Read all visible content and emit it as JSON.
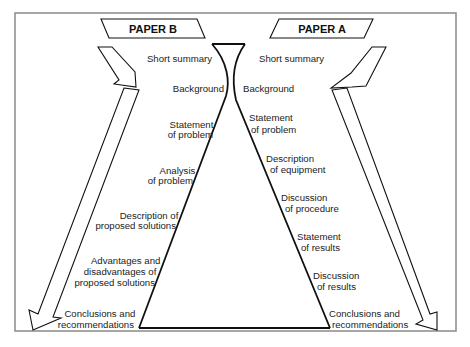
{
  "diagram": {
    "paper_b": {
      "title": "PAPER B",
      "sections": [
        [
          "Short summary"
        ],
        [
          "Background"
        ],
        [
          "Statement",
          "of problem"
        ],
        [
          "Analysis",
          "of problem"
        ],
        [
          "Description of",
          "proposed solutions"
        ],
        [
          "Advantages and",
          "disadvantages of",
          "proposed solutions"
        ],
        [
          "Conclusions and",
          "recommendations"
        ]
      ]
    },
    "paper_a": {
      "title": "PAPER A",
      "sections": [
        [
          "Short summary"
        ],
        [
          "Background"
        ],
        [
          "Statement",
          "of problem"
        ],
        [
          "Description",
          "of equipment"
        ],
        [
          "Discussion",
          "of procedure"
        ],
        [
          "Statement",
          "of results"
        ],
        [
          "Discussion",
          "of results"
        ],
        [
          "Conclusions and",
          "recommendations"
        ]
      ]
    },
    "colors": {
      "line": "#111111",
      "frame": "#8a8a8a",
      "text": "#222222"
    }
  }
}
